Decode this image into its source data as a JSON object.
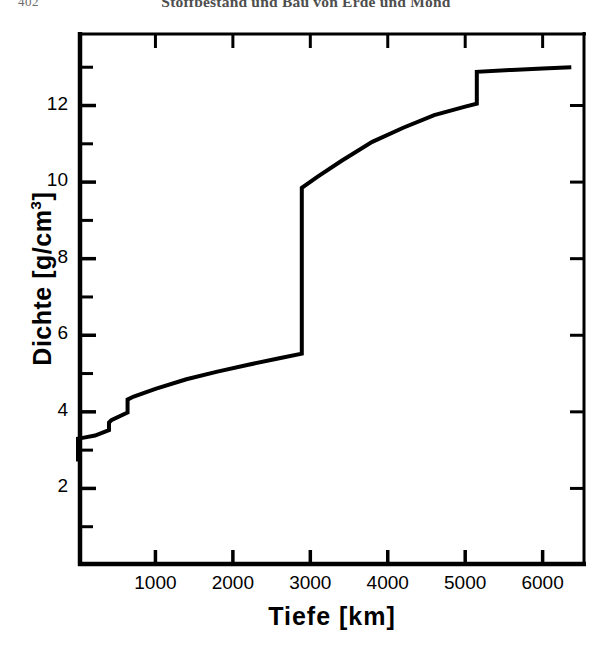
{
  "running_head": {
    "page_number": "402",
    "title": "Stoffbestand und Bau von Erde und Mond"
  },
  "chart_data": {
    "type": "line",
    "title": "",
    "xlabel": "Tiefe [km]",
    "ylabel": "Dichte [g/cm³]",
    "ylabel_text": "Dichte [g/cm",
    "ylabel_exponent": "3",
    "ylabel_tail": "]",
    "xlim": [
      0,
      6560
    ],
    "ylim": [
      0,
      13.9
    ],
    "grid": false,
    "legend": null,
    "x_major_ticks": [
      1000,
      2000,
      3000,
      4000,
      5000,
      6000
    ],
    "x_tick_labels": [
      "1000",
      "2000",
      "3000",
      "4000",
      "5000",
      "6000"
    ],
    "y_major_ticks": [
      2,
      4,
      6,
      8,
      10,
      12
    ],
    "y_tick_labels": [
      "2",
      "4",
      "6",
      "8",
      "10",
      "12"
    ],
    "y_minor_ticks": [
      1,
      3,
      5,
      7,
      9,
      11,
      13
    ],
    "series": [
      {
        "name": "Dichte der Erde",
        "color": "#000000",
        "line_width": 4,
        "points": [
          [
            0,
            2.7
          ],
          [
            0,
            3.3
          ],
          [
            60,
            3.32
          ],
          [
            220,
            3.38
          ],
          [
            400,
            3.52
          ],
          [
            400,
            3.72
          ],
          [
            430,
            3.78
          ],
          [
            640,
            3.98
          ],
          [
            640,
            4.32
          ],
          [
            700,
            4.38
          ],
          [
            720,
            4.4
          ],
          [
            1000,
            4.6
          ],
          [
            1400,
            4.85
          ],
          [
            1800,
            5.05
          ],
          [
            2200,
            5.23
          ],
          [
            2600,
            5.4
          ],
          [
            2890,
            5.52
          ],
          [
            2890,
            9.85
          ],
          [
            3100,
            10.15
          ],
          [
            3400,
            10.55
          ],
          [
            3800,
            11.05
          ],
          [
            4200,
            11.42
          ],
          [
            4600,
            11.75
          ],
          [
            5000,
            11.97
          ],
          [
            5150,
            12.05
          ],
          [
            5150,
            12.88
          ],
          [
            5600,
            12.93
          ],
          [
            6000,
            12.97
          ],
          [
            6370,
            13.0
          ]
        ]
      }
    ],
    "annotations": []
  },
  "axes_geometry": {
    "left_px": 78,
    "right_px": 586,
    "top_px": 32,
    "bottom_px": 565,
    "x_at_left": 0,
    "x_at_right": 6560,
    "y_at_bottom": 0,
    "y_at_top": 13.92
  }
}
